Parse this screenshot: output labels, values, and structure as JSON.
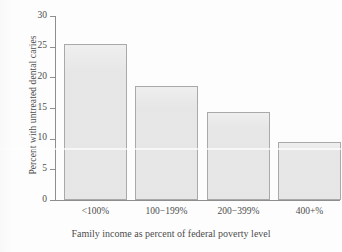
{
  "chart_data": {
    "type": "bar",
    "title": "",
    "subtitle": "",
    "xlabel": "Family income as percent of federal poverty level",
    "ylabel": "Percent with untreated dental caries",
    "categories": [
      "<100%",
      "100−199%",
      "200−399%",
      "400+%"
    ],
    "values": [
      25.5,
      18.6,
      14.4,
      9.5
    ],
    "ylim": [
      0,
      30
    ],
    "yticks": [
      0,
      5,
      10,
      15,
      20,
      25,
      30
    ],
    "ytick_labels": [
      "0",
      "5",
      "10",
      "15",
      "20",
      "25",
      "30"
    ],
    "grid": false,
    "legend": null,
    "legend_position": "none",
    "bar_fill_color": "#e9e9e9",
    "bar_border_color": "#a9a9a9",
    "axis_color": "#8e8e8e",
    "text_color": "#4d4d4d",
    "background_color": "#fdfdfd"
  }
}
